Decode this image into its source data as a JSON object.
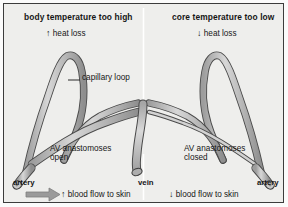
{
  "figure": {
    "type": "physiology-diagram",
    "background_color": "#eeeeec",
    "border_color": "#3c3c3c",
    "vessel_fill_color": "#bdbdbd",
    "vessel_outline_color": "#4a4a4a",
    "arrow_color": "#9a9a9a"
  },
  "panels": {
    "left": {
      "title": "body temperature too high",
      "heat": {
        "arrow": "↑",
        "label": "heat loss"
      },
      "anastomoses": {
        "line1": "AV anastomoses",
        "line2": "open"
      },
      "flow": {
        "arrow": "↑",
        "label": "blood flow to skin"
      },
      "vessel_end_label": "artery",
      "has_flow_arrow_graphic": true
    },
    "right": {
      "title": "core temperature too low",
      "heat": {
        "arrow": "↓",
        "label": "heat loss"
      },
      "anastomoses": {
        "line1": "AV anastomoses",
        "line2": "closed"
      },
      "flow": {
        "arrow": "↓",
        "label": "blood flow to skin"
      },
      "vessel_end_label": "artery",
      "has_flow_arrow_graphic": false
    }
  },
  "callouts": {
    "capillary_loop": "capillary loop"
  },
  "center": {
    "vein_label": "vein"
  }
}
